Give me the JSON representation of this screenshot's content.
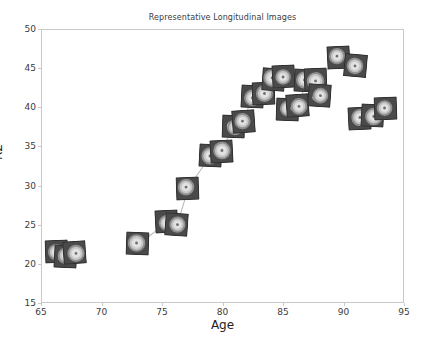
{
  "chart_data": {
    "type": "scatter",
    "title": "Representative Longitudinal Images",
    "xlabel": "Age",
    "ylabel": "R2",
    "xlim": [
      65,
      95
    ],
    "ylim": [
      15,
      50
    ],
    "xticks": [
      65,
      70,
      75,
      80,
      85,
      90,
      95
    ],
    "yticks": [
      15,
      20,
      25,
      30,
      35,
      40,
      45,
      50
    ],
    "grid": false,
    "legend": null,
    "marker_style": "image-thumbnail",
    "note": "Each data point is rendered as a small grayscale concentric-ring image thumbnail; thumbnails belonging to the same subject are joined by thin gray connector lines.",
    "points": [
      {
        "x": 66.3,
        "y": 21.6,
        "rot": -2
      },
      {
        "x": 67.0,
        "y": 21.0,
        "rot": 3
      },
      {
        "x": 67.8,
        "y": 21.4,
        "rot": -4
      },
      {
        "x": 73.0,
        "y": 22.6,
        "rot": 2
      },
      {
        "x": 75.4,
        "y": 25.4,
        "rot": -3
      },
      {
        "x": 76.2,
        "y": 25.0,
        "rot": 4
      },
      {
        "x": 77.1,
        "y": 29.6,
        "rot": -2
      },
      {
        "x": 79.0,
        "y": 33.8,
        "rot": 3
      },
      {
        "x": 79.9,
        "y": 34.3,
        "rot": -3
      },
      {
        "x": 80.9,
        "y": 37.6,
        "rot": 2
      },
      {
        "x": 81.7,
        "y": 38.2,
        "rot": -4
      },
      {
        "x": 82.5,
        "y": 41.4,
        "rot": 3
      },
      {
        "x": 83.4,
        "y": 41.8,
        "rot": -2
      },
      {
        "x": 84.2,
        "y": 43.6,
        "rot": 4
      },
      {
        "x": 85.0,
        "y": 43.9,
        "rot": -3
      },
      {
        "x": 85.4,
        "y": 39.7,
        "rot": 2
      },
      {
        "x": 86.2,
        "y": 40.2,
        "rot": -4
      },
      {
        "x": 86.9,
        "y": 43.4,
        "rot": 3
      },
      {
        "x": 87.7,
        "y": 43.5,
        "rot": -2
      },
      {
        "x": 88.0,
        "y": 41.5,
        "rot": 4
      },
      {
        "x": 89.6,
        "y": 46.3,
        "rot": -3
      },
      {
        "x": 91.0,
        "y": 45.3,
        "rot": 5
      },
      {
        "x": 91.3,
        "y": 38.6,
        "rot": -3
      },
      {
        "x": 92.4,
        "y": 38.9,
        "rot": 3
      },
      {
        "x": 93.5,
        "y": 39.9,
        "rot": -2
      }
    ],
    "connections": [
      [
        0,
        1
      ],
      [
        1,
        2
      ],
      [
        3,
        4
      ],
      [
        4,
        5
      ],
      [
        5,
        6
      ],
      [
        6,
        7
      ],
      [
        7,
        8
      ],
      [
        8,
        9
      ],
      [
        9,
        10
      ],
      [
        10,
        11
      ],
      [
        11,
        12
      ],
      [
        12,
        13
      ],
      [
        13,
        14
      ],
      [
        15,
        16
      ],
      [
        16,
        17
      ],
      [
        17,
        18
      ],
      [
        18,
        20
      ],
      [
        20,
        21
      ],
      [
        22,
        23
      ],
      [
        23,
        24
      ]
    ]
  },
  "colors": {
    "axis": "#c9c9c9",
    "tick_text": "#3b3b3b",
    "axis_title": "#222222",
    "thumb_bg": "#4a4a4a",
    "thumb_ring_outer": "#8f8f8f",
    "thumb_ring_mid": "#c6c6c6",
    "thumb_ring_inner": "#e2e2e2",
    "thumb_core": "#6e6e6e",
    "connector": "#b6b6b6",
    "page_bg": "#ffffff"
  }
}
